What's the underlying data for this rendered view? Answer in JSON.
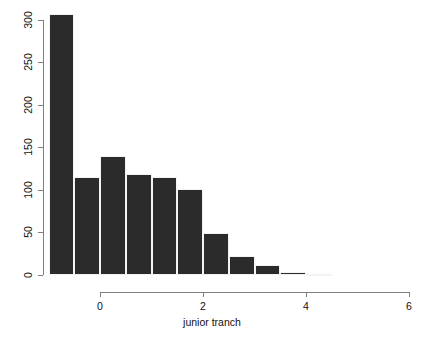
{
  "chart_data": {
    "type": "bar",
    "title": "",
    "subtitle": "",
    "xlabel": "junior tranch",
    "ylabel": "",
    "grid": false,
    "legend": null,
    "bin_width": 0.5,
    "xlim": [
      -1.0,
      6.0
    ],
    "ylim": [
      0,
      310
    ],
    "x_ticks": [
      0,
      2,
      4,
      6
    ],
    "x_tick_labels": [
      "0",
      "2",
      "4",
      "6"
    ],
    "y_ticks": [
      0,
      50,
      100,
      150,
      200,
      250,
      300
    ],
    "y_tick_labels": [
      "0",
      "50",
      "100",
      "150",
      "200",
      "250",
      "300"
    ],
    "bin_edges": [
      -1.0,
      -0.5,
      0.0,
      0.5,
      1.0,
      1.5,
      2.0,
      2.5,
      3.0,
      3.5,
      4.0,
      4.5
    ],
    "categories": [
      "[-1.0,-0.5)",
      "[-0.5,0.0)",
      "[0.0,0.5)",
      "[0.5,1.0)",
      "[1.0,1.5)",
      "[1.5,2.0)",
      "[2.0,2.5)",
      "[2.5,3.0)",
      "[3.0,3.5)",
      "[3.5,4.0)",
      "[4.0,4.5)"
    ],
    "values": [
      307,
      115,
      140,
      119,
      115,
      101,
      49,
      22,
      12,
      4,
      1
    ],
    "bar_color": "#2b2b2b",
    "axis_color": "#808080",
    "background": "#ffffff"
  },
  "axes": {
    "x_title": "junior tranch",
    "x_tick_labels": [
      "0",
      "2",
      "4",
      "6"
    ],
    "y_tick_labels": [
      "0",
      "50",
      "100",
      "150",
      "200",
      "250",
      "300"
    ]
  }
}
